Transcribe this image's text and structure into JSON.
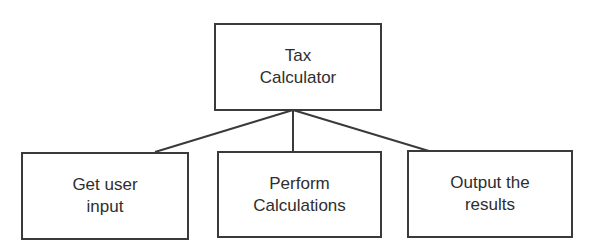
{
  "diagram": {
    "type": "hierarchy",
    "root": {
      "line1": "Tax",
      "line2": "Calculator"
    },
    "children": [
      {
        "line1": "Get user",
        "line2": "input"
      },
      {
        "line1": "Perform",
        "line2": "Calculations"
      },
      {
        "line1": "Output the",
        "line2": "results"
      }
    ],
    "colors": {
      "stroke": "#3a3a3a",
      "text": "#2e2e2e",
      "background": "#ffffff"
    }
  }
}
